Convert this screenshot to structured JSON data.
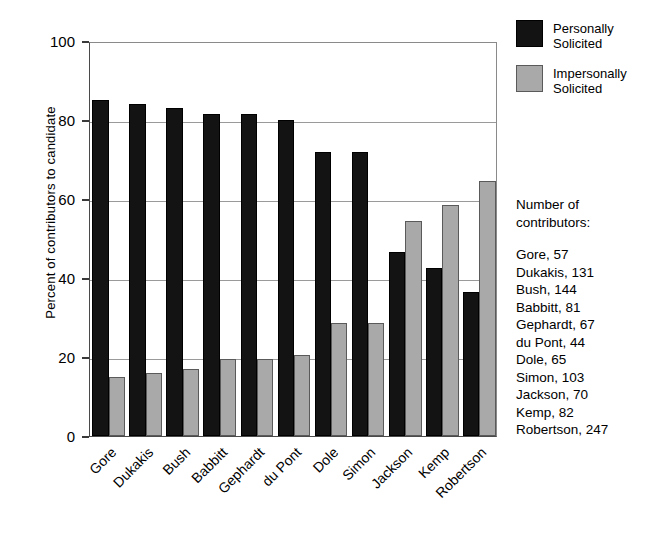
{
  "chart_data": {
    "type": "bar",
    "title": "",
    "xlabel": "",
    "ylabel": "Percent of contributors to candidate",
    "ylim": [
      0,
      100
    ],
    "yticks": [
      0,
      20,
      40,
      60,
      80,
      100
    ],
    "grid": true,
    "legend_position": "top-right",
    "categories": [
      "Gore",
      "Dukakis",
      "Bush",
      "Babbitt",
      "Gephardt",
      "du Pont",
      "Dole",
      "Simon",
      "Jackson",
      "Kemp",
      "Robertson"
    ],
    "series": [
      {
        "name": "Personally Solicited",
        "color": "#131313",
        "values": [
          85,
          84,
          83,
          81.5,
          81.5,
          80,
          72,
          72,
          46.5,
          42.5,
          36.5
        ]
      },
      {
        "name": "Impersonally Solicited",
        "color": "#a9a9a9",
        "values": [
          15,
          16,
          17,
          19.5,
          19.5,
          20.5,
          28.5,
          28.5,
          54.5,
          58.5,
          64.5
        ]
      }
    ]
  },
  "legend": {
    "items": [
      {
        "label_line1": "Personally",
        "label_line2": "Solicited",
        "swatch": "personal"
      },
      {
        "label_line1": "Impersonally",
        "label_line2": "Solicited",
        "swatch": "impersonal"
      }
    ]
  },
  "sidenote": {
    "title_line1": "Number of",
    "title_line2": "contributors:",
    "items": [
      "Gore, 57",
      "Dukakis, 131",
      "Bush, 144",
      "Babbitt, 81",
      "Gephardt, 67",
      "du Pont, 44",
      "Dole, 65",
      "Simon, 103",
      "Jackson, 70",
      "Kemp, 82",
      "Robertson, 247"
    ]
  }
}
